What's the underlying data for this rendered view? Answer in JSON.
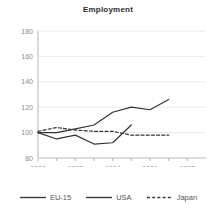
{
  "chart_data": {
    "type": "line",
    "title": "Employment",
    "xlabel": "",
    "ylabel": "",
    "xlim": [
      1990,
      1999
    ],
    "ylim": [
      80,
      180
    ],
    "yticks": [
      80,
      100,
      120,
      140,
      160,
      180
    ],
    "xticks": [
      1990,
      1992,
      1994,
      1996,
      1998
    ],
    "xminorticks": [
      1991,
      1993,
      1995,
      1997
    ],
    "grid": "horizontal",
    "legend_position": "bottom",
    "x": [
      1990,
      1991,
      1992,
      1993,
      1994,
      1995,
      1996,
      1997
    ],
    "series": [
      {
        "name": "EU-15",
        "style": "solid",
        "color": "#333333",
        "values": [
          100,
          100,
          103,
          106,
          116,
          120,
          118,
          126
        ]
      },
      {
        "name": "USA",
        "style": "solid",
        "color": "#333333",
        "values": [
          100,
          95,
          98,
          91,
          92,
          106,
          null,
          null
        ]
      },
      {
        "name": "Japan",
        "style": "dashed",
        "color": "#333333",
        "values": [
          101,
          104,
          102,
          101,
          101,
          98,
          98,
          98
        ]
      }
    ]
  },
  "legend": {
    "items": [
      {
        "label": "EU-15",
        "style": "solid"
      },
      {
        "label": "USA",
        "style": "solid"
      },
      {
        "label": "Japan",
        "style": "dashed"
      }
    ]
  },
  "axis": {
    "tick_label_color": "#8c8c8c",
    "axis_color": "#b8b8b8",
    "grid_color": "#ebebeb"
  }
}
